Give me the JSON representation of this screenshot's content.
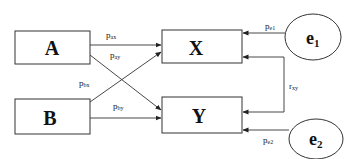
{
  "diagram": {
    "type": "path-diagram",
    "nodes": [
      {
        "id": "A",
        "label": "A",
        "shape": "rectangle"
      },
      {
        "id": "B",
        "label": "B",
        "shape": "rectangle"
      },
      {
        "id": "X",
        "label": "X",
        "shape": "rectangle"
      },
      {
        "id": "Y",
        "label": "Y",
        "shape": "rectangle"
      },
      {
        "id": "e1",
        "label": "e",
        "subscript": "1",
        "shape": "ellipse"
      },
      {
        "id": "e2",
        "label": "e",
        "subscript": "2",
        "shape": "ellipse"
      }
    ],
    "edges": [
      {
        "from": "A",
        "to": "X",
        "label": "p",
        "subscript": "ax"
      },
      {
        "from": "A",
        "to": "Y",
        "label": "p",
        "subscript": "ay"
      },
      {
        "from": "B",
        "to": "X",
        "label": "p",
        "subscript": "bx"
      },
      {
        "from": "B",
        "to": "Y",
        "label": "p",
        "subscript": "by"
      },
      {
        "from": "e1",
        "to": "X",
        "label": "p",
        "subscript": "e1"
      },
      {
        "from": "e2",
        "to": "Y",
        "label": "p",
        "subscript": "e2"
      },
      {
        "from": "X",
        "to": "Y",
        "label": "r",
        "subscript": "xy",
        "bidirectional": true
      }
    ],
    "colors": {
      "stroke": "#333333",
      "background": "#ffffff"
    }
  }
}
